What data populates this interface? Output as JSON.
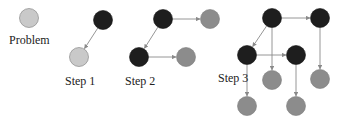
{
  "colors": {
    "dark": "#1e1e1e",
    "medium": "#8c8c8c",
    "light": "#c9c9c9",
    "edge": "#8a8a8a"
  },
  "labels": {
    "problem": "Problem",
    "step1": "Step 1",
    "step2": "Step 2",
    "step3": "Step 3"
  },
  "diagram": {
    "problem": {
      "nodes": [
        {
          "id": "p",
          "x": 29,
          "y": 18,
          "shade": "light"
        }
      ],
      "edges": []
    },
    "step1": {
      "nodes": [
        {
          "id": "s1a",
          "x": 103,
          "y": 20,
          "shade": "dark"
        },
        {
          "id": "s1b",
          "x": 79,
          "y": 57,
          "shade": "light"
        }
      ],
      "edges": [
        [
          "s1a",
          "s1b"
        ]
      ]
    },
    "step2": {
      "nodes": [
        {
          "id": "s2a",
          "x": 163,
          "y": 19,
          "shade": "dark"
        },
        {
          "id": "s2b",
          "x": 210,
          "y": 19,
          "shade": "medium"
        },
        {
          "id": "s2c",
          "x": 139,
          "y": 57,
          "shade": "dark"
        },
        {
          "id": "s2d",
          "x": 186,
          "y": 57,
          "shade": "medium"
        }
      ],
      "edges": [
        [
          "s2a",
          "s2b"
        ],
        [
          "s2a",
          "s2c"
        ],
        [
          "s2c",
          "s2d"
        ]
      ]
    },
    "step3": {
      "nodes": [
        {
          "id": "s3a",
          "x": 272,
          "y": 18,
          "shade": "dark"
        },
        {
          "id": "s3b",
          "x": 320,
          "y": 18,
          "shade": "dark"
        },
        {
          "id": "s3c",
          "x": 247,
          "y": 55,
          "shade": "dark"
        },
        {
          "id": "s3d",
          "x": 296,
          "y": 55,
          "shade": "dark"
        },
        {
          "id": "s3e",
          "x": 272,
          "y": 80,
          "shade": "medium"
        },
        {
          "id": "s3f",
          "x": 320,
          "y": 79,
          "shade": "medium"
        },
        {
          "id": "s3g",
          "x": 247,
          "y": 106,
          "shade": "medium"
        },
        {
          "id": "s3h",
          "x": 296,
          "y": 106,
          "shade": "medium"
        }
      ],
      "edges": [
        [
          "s3a",
          "s3b"
        ],
        [
          "s3a",
          "s3c"
        ],
        [
          "s3a",
          "s3e"
        ],
        [
          "s3b",
          "s3f"
        ],
        [
          "s3c",
          "s3d"
        ],
        [
          "s3c",
          "s3g"
        ],
        [
          "s3d",
          "s3h"
        ]
      ]
    }
  }
}
